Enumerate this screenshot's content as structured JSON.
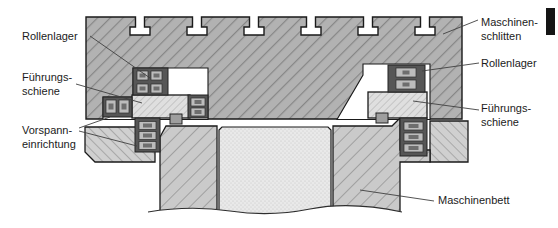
{
  "figure": {
    "labels_left": {
      "rollenlager": "Rollenlager",
      "fuehrungsschiene_line1": "Führungs-",
      "fuehrungsschiene_line2": "schiene",
      "vorspanneinrichtung_line1": "Vorspann-",
      "vorspanneinrichtung_line2": "einrichtung"
    },
    "labels_right": {
      "maschinenschlitten_line1": "Maschinen-",
      "maschinenschlitten_line2": "schlitten",
      "rollenlager": "Rollenlager",
      "fuehrungsschiene_line1": "Führungs-",
      "fuehrungsschiene_line2": "schiene",
      "maschinenbett": "Maschinenbett"
    },
    "colors": {
      "slide_fill": "#b2b2b2",
      "bed_fill": "#cacaca",
      "clamp_fill": "#d0d0d0",
      "rail_fill": "#dfdfdf",
      "bearing_fill": "#565656",
      "roller_fill": "#bcbcbc",
      "roller_core": "#6e6e6e",
      "stipple_fill": "#e9e9e9",
      "outline": "#1a1a1a",
      "corner_bar": "#151515"
    }
  }
}
